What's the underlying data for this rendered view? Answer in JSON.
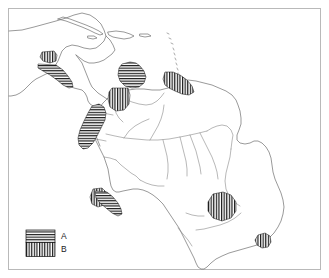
{
  "figure": {
    "type": "distribution-map",
    "region_depicted": "Latin America (Mexico, Central America, Caribbean, northern and eastern South America)",
    "frame_color": "#b9b9b9",
    "coastline_color": "#6e6e6e",
    "hatch_color": "#111111",
    "background_color": "#ffffff"
  },
  "legend": {
    "name": "map-legend",
    "entries": [
      {
        "key": "A",
        "label": "A",
        "pattern": "horizontal-lines"
      },
      {
        "key": "B",
        "label": "B",
        "pattern": "vertical-lines"
      }
    ]
  },
  "distribution_areas": [
    {
      "id": "mexico-sierra-madre-occidental",
      "pattern": "vertical-lines",
      "legend_key": "B"
    },
    {
      "id": "mexico-pacific-coast-guerrero-oaxaca",
      "pattern": "horizontal-lines",
      "legend_key": "A"
    },
    {
      "id": "venezuela-coastal-cordillera",
      "pattern": "horizontal-lines",
      "legend_key": "A"
    },
    {
      "id": "colombia-llanos-orinoco",
      "pattern": "vertical-lines",
      "legend_key": "B"
    },
    {
      "id": "guianas-coast",
      "pattern": "vertical-lines",
      "legend_key": "B"
    },
    {
      "id": "colombia-central-andes",
      "pattern": "horizontal-lines",
      "legend_key": "A"
    },
    {
      "id": "peru-northern-andes",
      "pattern": "vertical-lines",
      "legend_key": "B"
    },
    {
      "id": "peru-pacific-slope",
      "pattern": "horizontal-lines",
      "legend_key": "A"
    },
    {
      "id": "brazil-central-plateau",
      "pattern": "vertical-lines",
      "legend_key": "B"
    },
    {
      "id": "brazil-southeast-coast",
      "pattern": "vertical-lines",
      "legend_key": "B"
    }
  ],
  "geography": {
    "landmasses": [
      "North America (southern United States and Mexico)",
      "Central America",
      "Cuba",
      "Hispaniola",
      "Jamaica",
      "Puerto Rico",
      "Lesser Antilles",
      "Trinidad",
      "South America"
    ],
    "rivers_shown": [
      "Amazon",
      "Orinoco",
      "Negro",
      "Madeira",
      "Tapajos",
      "Xingu",
      "Tocantins",
      "Sao Francisco",
      "Parana"
    ]
  }
}
